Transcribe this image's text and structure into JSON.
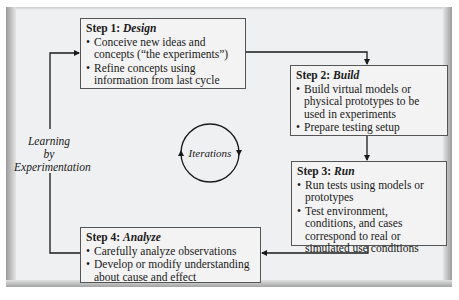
{
  "diagram": {
    "type": "cycle-flowchart",
    "side_label": {
      "line1": "Learning",
      "line2": "by",
      "line3": "Experimentation"
    },
    "center_label": "Iterations",
    "steps": [
      {
        "prefix": "Step 1: ",
        "name": "Design",
        "bullets": [
          "Conceive new ideas and concepts (“the experiments”)",
          "Refine concepts using information from last cycle"
        ]
      },
      {
        "prefix": "Step 2: ",
        "name": "Build",
        "bullets": [
          "Build virtual models or physical prototypes to be used in experiments",
          "Prepare testing setup"
        ]
      },
      {
        "prefix": "Step 3: ",
        "name": "Run",
        "bullets": [
          "Run tests using models or prototypes",
          "Test environment, conditions, and cases correspond to real or simulated use conditions"
        ]
      },
      {
        "prefix": "Step 4: ",
        "name": "Analyze",
        "bullets": [
          "Carefully analyze observations",
          "Develop or modify understanding about cause and effect"
        ]
      }
    ],
    "flow": [
      "Step 1",
      "Step 2",
      "Step 3",
      "Step 4",
      "Step 1"
    ],
    "colors": {
      "panel_background": "#eff0f1",
      "box_background": "#f3f3f3",
      "line": "#1a1a1a"
    }
  }
}
